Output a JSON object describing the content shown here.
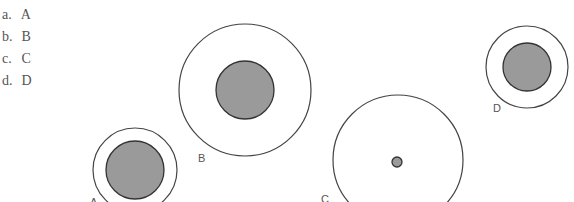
{
  "choices": [
    {
      "letter": "a.",
      "answer": "A"
    },
    {
      "letter": "b.",
      "answer": "B"
    },
    {
      "letter": "c.",
      "answer": "C"
    },
    {
      "letter": "d.",
      "answer": "D"
    }
  ],
  "diagram": {
    "stroke_color": "#444444",
    "outer_fill": "#ffffff",
    "inner_fill": "#9a9a9a",
    "circles": [
      {
        "label": "A",
        "outer": {
          "cx": 135,
          "cy": 170,
          "r": 42
        },
        "inner": {
          "cx": 135,
          "cy": 170,
          "r": 29
        },
        "label_pos": {
          "x": 90,
          "y": 206
        }
      },
      {
        "label": "B",
        "outer": {
          "cx": 245,
          "cy": 90,
          "r": 66
        },
        "inner": {
          "cx": 245,
          "cy": 90,
          "r": 29
        },
        "label_pos": {
          "x": 198,
          "y": 162
        }
      },
      {
        "label": "C",
        "outer": {
          "cx": 398,
          "cy": 160,
          "r": 65
        },
        "inner": {
          "cx": 397,
          "cy": 162,
          "r": 5
        },
        "label_pos": {
          "x": 321,
          "y": 203
        }
      },
      {
        "label": "D",
        "outer": {
          "cx": 527,
          "cy": 67,
          "r": 41
        },
        "inner": {
          "cx": 527,
          "cy": 67,
          "r": 24
        },
        "label_pos": {
          "x": 493,
          "y": 112
        }
      }
    ]
  }
}
